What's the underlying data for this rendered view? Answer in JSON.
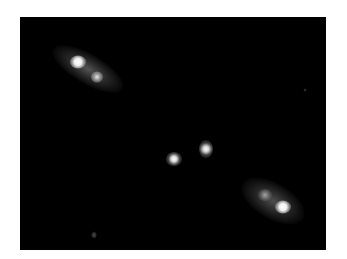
{
  "image": {
    "description": "Grayscale astronomical image on black background showing two extended bright lobes at upper-left and lower-right with two compact sources near the center",
    "background_color": "#000000",
    "border_color": "#ffffff"
  }
}
